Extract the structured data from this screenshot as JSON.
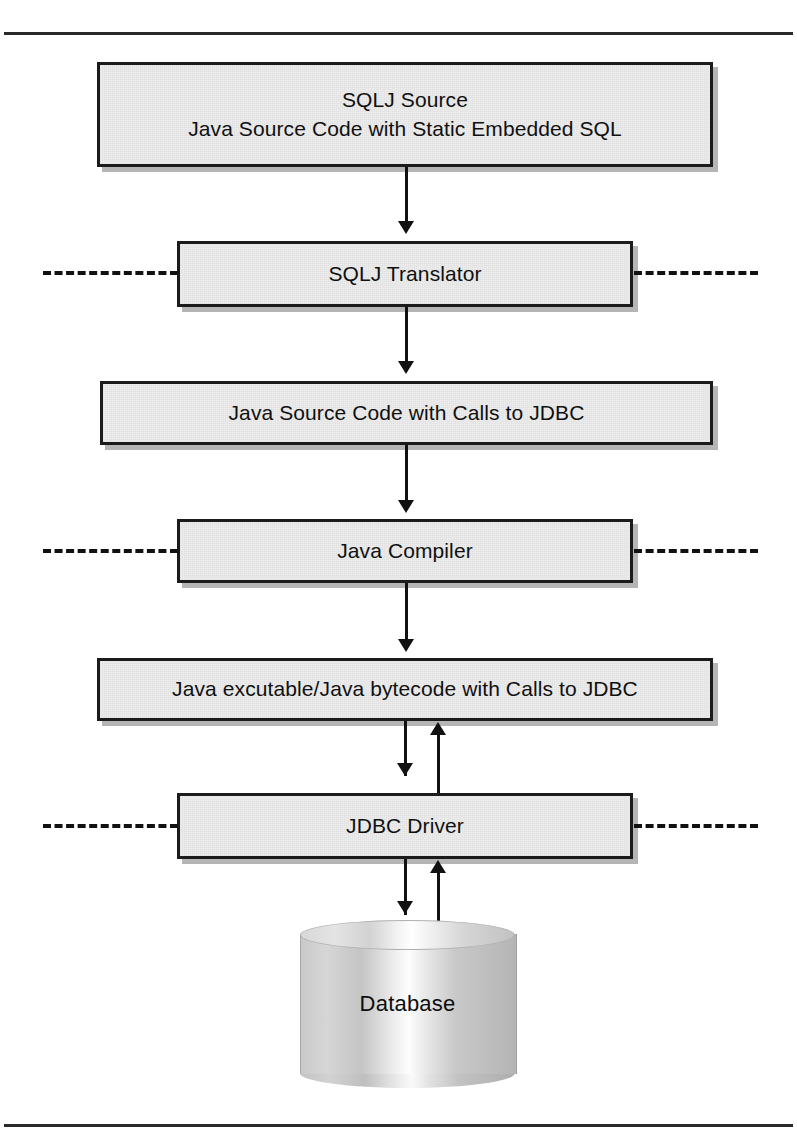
{
  "diagram": {
    "colors": {
      "box_fill": "#e3e3e3",
      "box_border": "#1b1b1b",
      "connector": "#111111",
      "rule": "#2a2a2a"
    },
    "nodes": [
      {
        "id": "sqlj-source",
        "type": "process-box",
        "lines": [
          "SQLJ Source",
          "Java Source Code with Static Embedded SQL"
        ]
      },
      {
        "id": "sqlj-translator",
        "type": "process-box",
        "lines": [
          "SQLJ Translator"
        ]
      },
      {
        "id": "java-source-jdbc",
        "type": "process-box",
        "lines": [
          "Java Source Code with Calls to JDBC"
        ]
      },
      {
        "id": "java-compiler",
        "type": "process-box",
        "lines": [
          "Java Compiler"
        ]
      },
      {
        "id": "java-bytecode",
        "type": "process-box",
        "lines": [
          "Java excutable/Java bytecode with Calls to JDBC"
        ]
      },
      {
        "id": "jdbc-driver",
        "type": "process-box",
        "lines": [
          "JDBC Driver"
        ]
      },
      {
        "id": "database",
        "type": "cylinder",
        "lines": [
          "Database"
        ]
      }
    ],
    "boundary_lines": [
      {
        "id": "translator-boundary-left"
      },
      {
        "id": "translator-boundary-right"
      },
      {
        "id": "compiler-boundary-left"
      },
      {
        "id": "compiler-boundary-right"
      },
      {
        "id": "driver-boundary-left"
      },
      {
        "id": "driver-boundary-right"
      }
    ],
    "connectors": [
      {
        "id": "source-to-translator",
        "direction": "down"
      },
      {
        "id": "translator-to-javasource",
        "direction": "down"
      },
      {
        "id": "javasource-to-compiler",
        "direction": "down"
      },
      {
        "id": "compiler-to-bytecode",
        "direction": "down"
      },
      {
        "id": "bytecode-to-driver",
        "direction": "down"
      },
      {
        "id": "driver-to-bytecode",
        "direction": "up"
      },
      {
        "id": "driver-to-database",
        "direction": "down"
      },
      {
        "id": "database-to-driver",
        "direction": "up"
      }
    ]
  }
}
